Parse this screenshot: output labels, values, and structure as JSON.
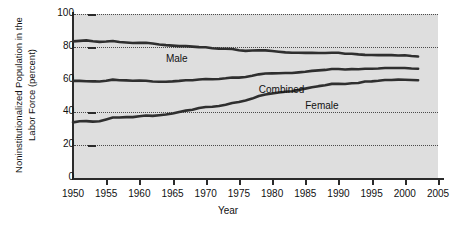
{
  "chart_data": {
    "type": "line",
    "title": "",
    "xlabel": "Year",
    "ylabel": "Noninstitutionalized Population in the Labor Force (percent)",
    "xlim": [
      1950,
      2005
    ],
    "ylim": [
      0,
      100
    ],
    "xticks": [
      1950,
      1955,
      1960,
      1965,
      1970,
      1975,
      1980,
      1985,
      1990,
      1995,
      2000,
      2005
    ],
    "yticks": [
      0,
      20,
      40,
      60,
      80,
      100
    ],
    "gridlines": [
      20,
      40,
      80,
      100
    ],
    "grid": "horizontal-dotted",
    "legend": "inline-labels",
    "plot_background": "#dedede",
    "line_color": "#2f2f2f",
    "x": [
      1950,
      1951,
      1952,
      1953,
      1954,
      1955,
      1956,
      1957,
      1958,
      1959,
      1960,
      1961,
      1962,
      1963,
      1964,
      1965,
      1966,
      1967,
      1968,
      1969,
      1970,
      1971,
      1972,
      1973,
      1974,
      1975,
      1976,
      1977,
      1978,
      1979,
      1980,
      1981,
      1982,
      1983,
      1984,
      1985,
      1986,
      1987,
      1988,
      1989,
      1990,
      1991,
      1992,
      1993,
      1994,
      1995,
      1996,
      1997,
      1998,
      1999,
      2000,
      2001,
      2002
    ],
    "series": [
      {
        "name": "Male",
        "label": "Male",
        "values": [
          83.3,
          83.6,
          83.9,
          83.4,
          83.0,
          83.2,
          83.5,
          82.9,
          82.6,
          82.3,
          82.4,
          82.5,
          82.0,
          81.4,
          81.0,
          80.7,
          80.4,
          80.4,
          80.1,
          79.8,
          79.7,
          79.1,
          78.9,
          78.8,
          78.7,
          77.9,
          77.5,
          77.7,
          77.9,
          77.8,
          77.4,
          77.0,
          76.6,
          76.4,
          76.4,
          76.3,
          76.3,
          76.2,
          76.2,
          76.4,
          76.4,
          75.8,
          75.8,
          75.4,
          75.1,
          75.0,
          74.9,
          75.0,
          74.9,
          74.7,
          74.8,
          74.4,
          74.1
        ]
      },
      {
        "name": "Combined",
        "label": "Combined",
        "values": [
          59.2,
          59.2,
          59.0,
          58.9,
          58.8,
          59.3,
          60.0,
          59.6,
          59.5,
          59.3,
          59.4,
          59.3,
          58.8,
          58.7,
          58.7,
          58.9,
          59.2,
          59.6,
          59.6,
          60.1,
          60.4,
          60.2,
          60.4,
          60.8,
          61.3,
          61.2,
          61.6,
          62.3,
          63.2,
          63.7,
          63.8,
          63.9,
          64.0,
          64.0,
          64.4,
          64.8,
          65.3,
          65.6,
          65.9,
          66.5,
          66.5,
          66.2,
          66.4,
          66.3,
          66.6,
          66.6,
          66.8,
          67.1,
          67.1,
          67.1,
          67.1,
          66.8,
          66.6
        ]
      },
      {
        "name": "Female",
        "label": "Female",
        "values": [
          33.9,
          34.6,
          34.7,
          34.4,
          34.6,
          35.7,
          36.9,
          36.9,
          37.1,
          37.1,
          37.7,
          38.1,
          37.9,
          38.3,
          38.7,
          39.3,
          40.3,
          41.1,
          41.6,
          42.7,
          43.3,
          43.4,
          43.9,
          44.7,
          45.7,
          46.3,
          47.3,
          48.4,
          50.0,
          50.9,
          51.5,
          52.1,
          52.6,
          52.9,
          53.6,
          54.5,
          55.3,
          56.0,
          56.6,
          57.4,
          57.5,
          57.3,
          57.8,
          57.9,
          58.8,
          58.9,
          59.3,
          59.8,
          59.8,
          60.0,
          59.9,
          59.8,
          59.6
        ]
      }
    ],
    "annotations": [
      {
        "text": "Male",
        "x": 1964,
        "y": 72
      },
      {
        "text": "Combined",
        "x": 1978,
        "y": 53
      },
      {
        "text": "Female",
        "x": 1985,
        "y": 43
      }
    ]
  }
}
